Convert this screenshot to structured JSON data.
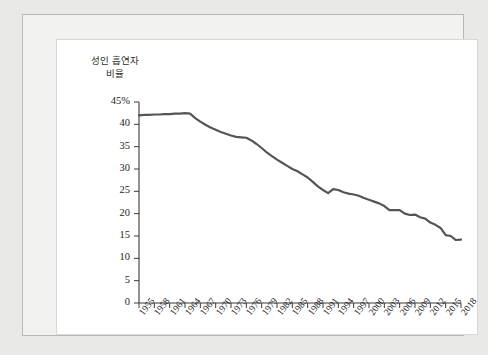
{
  "figure": {
    "y_axis_title_line1": "성인 흡연자",
    "y_axis_title_line2": "비율"
  },
  "colors": {
    "line": "#555555",
    "axis": "#3a3a3a",
    "page_background": "#e9e9e7",
    "frame_background": "#f2f2f0",
    "panel_background": "#ffffff",
    "text": "#1d1d1d"
  },
  "chart_data": {
    "type": "line",
    "title": "",
    "subtitle": "",
    "xlabel": "",
    "ylabel": "성인 흡연자 비율",
    "ylim": [
      0,
      45
    ],
    "xlim": [
      1955,
      2018
    ],
    "grid": false,
    "legend": false,
    "y_ticks": [
      "0",
      "5",
      "10",
      "15",
      "20",
      "25",
      "30",
      "35",
      "40",
      "45%"
    ],
    "y_tick_values": [
      0,
      5,
      10,
      15,
      20,
      25,
      30,
      35,
      40,
      45
    ],
    "x_ticks": [
      "1955",
      "1958",
      "1961",
      "1964",
      "1967",
      "1970",
      "1973",
      "1976",
      "1979",
      "1982",
      "1985",
      "1988",
      "1991",
      "1994",
      "1997",
      "2000",
      "2003",
      "2006",
      "2009",
      "2012",
      "2015",
      "2018"
    ],
    "x_tick_values": [
      1955,
      1958,
      1961,
      1964,
      1967,
      1970,
      1973,
      1976,
      1979,
      1982,
      1985,
      1988,
      1991,
      1994,
      1997,
      2000,
      2003,
      2006,
      2009,
      2012,
      2015,
      2018
    ],
    "series": [
      {
        "name": "성인 흡연자 비율",
        "x": [
          1955,
          1956,
          1957,
          1958,
          1959,
          1960,
          1961,
          1962,
          1963,
          1964,
          1965,
          1966,
          1967,
          1968,
          1969,
          1970,
          1971,
          1972,
          1973,
          1974,
          1975,
          1976,
          1977,
          1978,
          1979,
          1980,
          1981,
          1982,
          1983,
          1984,
          1985,
          1986,
          1987,
          1988,
          1989,
          1990,
          1991,
          1992,
          1993,
          1994,
          1995,
          1996,
          1997,
          1998,
          1999,
          2000,
          2001,
          2002,
          2003,
          2004,
          2005,
          2006,
          2007,
          2008,
          2009,
          2010,
          2011,
          2012,
          2013,
          2014,
          2015,
          2016,
          2017,
          2018
        ],
        "y": [
          42.0,
          42.1,
          42.1,
          42.2,
          42.2,
          42.3,
          42.3,
          42.4,
          42.4,
          42.5,
          42.4,
          41.4,
          40.6,
          39.9,
          39.3,
          38.8,
          38.3,
          37.9,
          37.5,
          37.2,
          37.1,
          37.0,
          36.4,
          35.6,
          34.7,
          33.7,
          32.9,
          32.1,
          31.4,
          30.7,
          30.0,
          29.5,
          28.8,
          28.1,
          27.1,
          26.1,
          25.3,
          24.6,
          25.5,
          25.3,
          24.8,
          24.5,
          24.3,
          24.0,
          23.5,
          23.1,
          22.7,
          22.3,
          21.7,
          20.8,
          20.8,
          20.8,
          20.0,
          19.7,
          19.8,
          19.2,
          18.9,
          18.0,
          17.5,
          16.8,
          15.2,
          15.0,
          14.1,
          14.2
        ]
      }
    ]
  }
}
